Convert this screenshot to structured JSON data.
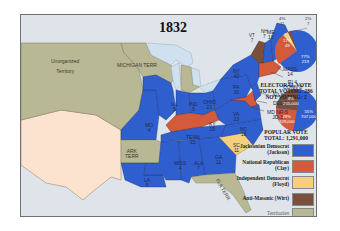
{
  "title": "1832",
  "colors": {
    "jackson": "#2f5fcf",
    "clay": "#d45a3c",
    "floyd": "#f6cf7e",
    "wirt": "#7a4f3c",
    "territory": "#b8b894",
    "foreign": "#fbe3cf",
    "water": "#dfe4ea",
    "lakes": "#cfe0ef"
  },
  "territories": {
    "unorganized": "Unorganized\n\nTerritory",
    "michigan": "MICHIGAN TERR",
    "arkansas": "ARK\nTERR",
    "florida": "FLA TERR"
  },
  "states": [
    {
      "abbr": "ME",
      "ev": "10",
      "party": "jackson"
    },
    {
      "abbr": "NH",
      "ev": "7",
      "party": "jackson"
    },
    {
      "abbr": "VT",
      "ev": "7",
      "party": "wirt"
    },
    {
      "abbr": "MASS",
      "ev": "14",
      "party": "clay"
    },
    {
      "abbr": "RI",
      "ev": "4",
      "party": "clay"
    },
    {
      "abbr": "CONN",
      "ev": "8",
      "party": "clay"
    },
    {
      "abbr": "NY",
      "ev": "42",
      "party": "jackson"
    },
    {
      "abbr": "NJ",
      "ev": "8",
      "party": "jackson"
    },
    {
      "abbr": "DEL",
      "ev": "3",
      "party": "clay"
    },
    {
      "abbr": "MD",
      "ev": "NR-5\nJD-3",
      "party": "clay"
    },
    {
      "abbr": "PA",
      "ev": "30",
      "party": "jackson"
    },
    {
      "abbr": "VA",
      "ev": "23",
      "party": "jackson"
    },
    {
      "abbr": "NC",
      "ev": "15",
      "party": "jackson"
    },
    {
      "abbr": "SC",
      "ev": "11",
      "party": "floyd"
    },
    {
      "abbr": "GA",
      "ev": "11",
      "party": "jackson"
    },
    {
      "abbr": "OHIO",
      "ev": "21",
      "party": "jackson"
    },
    {
      "abbr": "IND",
      "ev": "9",
      "party": "jackson"
    },
    {
      "abbr": "ILL",
      "ev": "5",
      "party": "jackson"
    },
    {
      "abbr": "KY",
      "ev": "15",
      "party": "clay"
    },
    {
      "abbr": "TENN",
      "ev": "15",
      "party": "jackson"
    },
    {
      "abbr": "MO",
      "ev": "4",
      "party": "jackson"
    },
    {
      "abbr": "MISS",
      "ev": "4",
      "party": "jackson"
    },
    {
      "abbr": "ALA",
      "ev": "7",
      "party": "jackson"
    },
    {
      "abbr": "LA",
      "ev": "5",
      "party": "jackson"
    }
  ],
  "electoral_vote": {
    "heading": "ELECTORAL VOTE",
    "total_voting": "TOTAL VOTING: 286",
    "not_voting": "NOT VOTING: 2",
    "slices": [
      {
        "party": "jackson",
        "pct": "77%",
        "votes": "219"
      },
      {
        "party": "clay",
        "pct": "17%",
        "votes": "49"
      },
      {
        "party": "floyd",
        "pct": "4%",
        "votes": "11"
      },
      {
        "party": "wirt",
        "pct": "2%",
        "votes": "7"
      }
    ]
  },
  "popular_vote": {
    "heading": "POPULAR VOTE",
    "total": "TOTAL: 1,291,000",
    "slices": [
      {
        "party": "jackson",
        "pct": "55%",
        "votes": "707,000"
      },
      {
        "party": "clay",
        "pct": "29%",
        "votes": "329,000"
      },
      {
        "party": "wirt",
        "pct": "8%",
        "votes": "255,000"
      }
    ]
  },
  "legend": [
    {
      "label": "Jacksonian Democrat\n(Jackson)",
      "color": "#2f5fcf"
    },
    {
      "label": "National Republican\n(Clay)",
      "color": "#d45a3c"
    },
    {
      "label": "Independent Democrat\n(Floyd)",
      "color": "#f6cf7e"
    },
    {
      "label": "Anti-Masonic (Wirt)",
      "color": "#7a4f3c"
    },
    {
      "label": "Territories",
      "color": "#b8b894"
    }
  ]
}
